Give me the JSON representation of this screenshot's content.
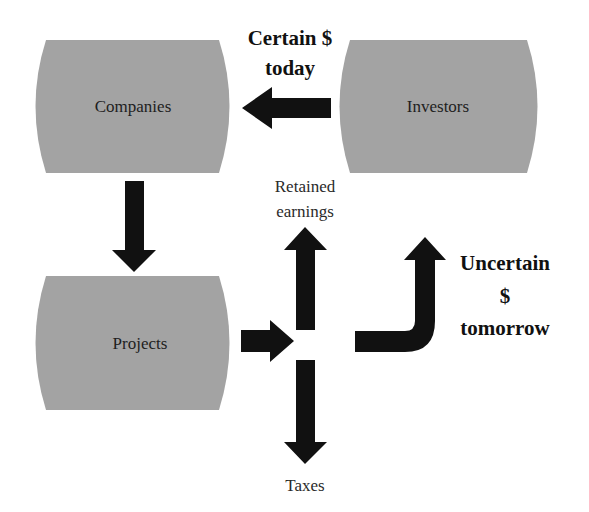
{
  "colors": {
    "box_fill": "#a3a3a3",
    "arrow_fill": "#111111",
    "background": "#ffffff",
    "text": "#1e1e1e"
  },
  "nodes": {
    "companies": {
      "label": "Companies"
    },
    "investors": {
      "label": "Investors"
    },
    "projects": {
      "label": "Projects"
    }
  },
  "flows": {
    "investors_to_companies": {
      "label_line1": "Certain $",
      "label_line2": "today"
    },
    "retained": {
      "label_line1": "Retained",
      "label_line2": "earnings"
    },
    "taxes": {
      "label": "Taxes"
    },
    "return_to_investors": {
      "label_line1": "Uncertain",
      "label_line2": "$",
      "label_line3": "tomorrow"
    }
  }
}
